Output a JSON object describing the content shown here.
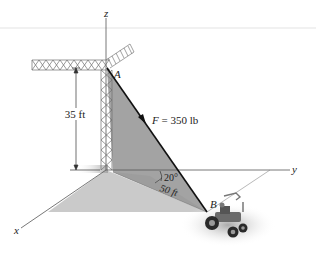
{
  "figure": {
    "type": "3D statics diagram: crane cable pulling on tractor",
    "axes": {
      "x_label": "x",
      "y_label": "y",
      "z_label": "z"
    },
    "points": {
      "A_label": "A",
      "B_label": "B"
    },
    "force": {
      "label": "F = 350 lb",
      "symbol": "F",
      "value": "350 lb"
    },
    "dimensions": {
      "height": "35 ft",
      "horizontal_distance": "50 ft",
      "angle": "20°"
    },
    "colors": {
      "background": "#ffffff",
      "ground_plane": "#c9c9c9",
      "vertical_plane": "#a0a0a0",
      "axis_line": "#555555",
      "cable": "#111111",
      "crane": "#6f6f6f"
    }
  }
}
